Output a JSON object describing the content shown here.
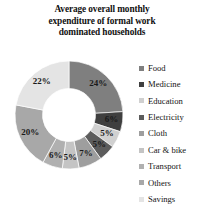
{
  "chart_data": {
    "type": "pie",
    "variant": "doughnut",
    "title": "Average overall monthly expenditure of formal work dominated households",
    "title_lines": [
      "Average overall monthly",
      "expenditure of formal work",
      "dominated households"
    ],
    "categories": [
      "Food",
      "Medicine",
      "Education",
      "Electricity",
      "Cloth",
      "Car & bike",
      "Transport",
      "Others",
      "Savings"
    ],
    "values": [
      24,
      6,
      5,
      5,
      7,
      5,
      6,
      20,
      22
    ],
    "labels": [
      "24%",
      "6%",
      "5%",
      "5%",
      "7%",
      "5%",
      "6%",
      "20%",
      "22%"
    ],
    "colors": [
      "#7f7f7f",
      "#3f3f3f",
      "#d0d0d0",
      "#5c5c5c",
      "#9e9e9e",
      "#c4c4c4",
      "#b0b0b0",
      "#a8a8a8",
      "#e4e4e4"
    ],
    "units": "percent",
    "total": 100,
    "start_angle": 0,
    "direction": "clockwise",
    "legend_position": "right",
    "grid": false,
    "xlabel": "",
    "ylabel": ""
  },
  "legend": {
    "items": [
      {
        "label": "Food",
        "color": "#7f7f7f"
      },
      {
        "label": "Medicine",
        "color": "#3f3f3f"
      },
      {
        "label": "Education",
        "color": "#d0d0d0"
      },
      {
        "label": "Electricity",
        "color": "#5c5c5c"
      },
      {
        "label": "Cloth",
        "color": "#9e9e9e"
      },
      {
        "label": "Car & bike",
        "color": "#c4c4c4"
      },
      {
        "label": "Transport",
        "color": "#b0b0b0"
      },
      {
        "label": "Others",
        "color": "#a8a8a8"
      },
      {
        "label": "Savings",
        "color": "#e4e4e4"
      }
    ]
  }
}
